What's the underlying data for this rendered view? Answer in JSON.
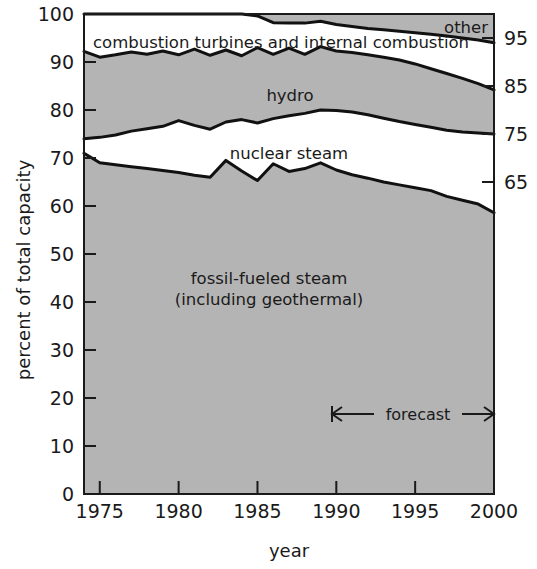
{
  "chart_data": {
    "type": "area",
    "title": "",
    "subtitle": "",
    "xlabel": "year",
    "ylabel": "percent of total capacity",
    "xlim": [
      1974,
      2000
    ],
    "ylim": [
      0,
      100
    ],
    "grid": false,
    "legend_position": "inline-labels",
    "stacked": true,
    "x": [
      1974,
      1975,
      1976,
      1977,
      1978,
      1979,
      1980,
      1981,
      1982,
      1983,
      1984,
      1985,
      1986,
      1987,
      1988,
      1989,
      1990,
      1991,
      1992,
      1993,
      1994,
      1995,
      1996,
      1997,
      1998,
      1999,
      2000
    ],
    "x_tick_labels": [
      "1975",
      "1980",
      "1985",
      "1990",
      "1995",
      "2000"
    ],
    "x_ticks": [
      1975,
      1980,
      1985,
      1990,
      1995,
      2000
    ],
    "y_tick_labels": [
      "0",
      "10",
      "20",
      "30",
      "40",
      "50",
      "60",
      "70",
      "80",
      "90",
      "100"
    ],
    "y_ticks": [
      0,
      10,
      20,
      30,
      40,
      50,
      60,
      70,
      80,
      90,
      100
    ],
    "y_right_tick_labels": [
      "65",
      "75",
      "85",
      "95"
    ],
    "y_right_ticks": [
      65,
      75,
      85,
      95
    ],
    "series": [
      {
        "name": "fossil-fueled steam (including geothermal)",
        "label": "fossil-fueled steam",
        "label_line2": "(including geothermal)",
        "fill": "#b4b4b4",
        "cumulative_top": [
          71.0,
          69.0,
          68.6,
          68.2,
          67.8,
          67.4,
          67.0,
          66.4,
          66.0,
          69.5,
          67.3,
          65.3,
          68.8,
          67.2,
          67.8,
          69.0,
          67.5,
          66.5,
          65.8,
          65.0,
          64.4,
          63.8,
          63.2,
          62.0,
          61.2,
          60.4,
          58.6
        ]
      },
      {
        "name": "nuclear steam",
        "label": "nuclear steam",
        "fill": "#ffffff",
        "cumulative_top": [
          74.0,
          74.3,
          74.8,
          75.6,
          76.1,
          76.6,
          77.8,
          76.8,
          76.0,
          77.5,
          78.0,
          77.3,
          78.2,
          78.8,
          79.3,
          80.0,
          79.9,
          79.6,
          79.0,
          78.3,
          77.6,
          77.0,
          76.4,
          75.8,
          75.4,
          75.2,
          75.0
        ]
      },
      {
        "name": "hydro",
        "label": "hydro",
        "fill": "#b4b4b4",
        "cumulative_top": [
          92.2,
          91.0,
          91.5,
          92.1,
          91.6,
          92.3,
          91.5,
          92.7,
          91.4,
          92.5,
          91.3,
          93.0,
          91.6,
          92.9,
          91.6,
          93.2,
          92.3,
          92.0,
          91.5,
          91.0,
          90.4,
          89.6,
          88.6,
          87.6,
          86.6,
          85.5,
          84.2
        ]
      },
      {
        "name": "combustion turbines and internal combustion",
        "label": "combustion turbines and internal combustion",
        "fill": "#ffffff",
        "cumulative_top": [
          100.0,
          100.0,
          100.0,
          100.0,
          100.0,
          100.0,
          100.0,
          100.0,
          100.0,
          100.0,
          100.0,
          99.6,
          98.2,
          98.1,
          98.1,
          98.5,
          97.8,
          97.4,
          97.0,
          96.7,
          96.4,
          96.1,
          95.8,
          95.4,
          95.0,
          94.6,
          94.0
        ]
      },
      {
        "name": "other",
        "label": "other",
        "fill": "#b4b4b4",
        "cumulative_top": [
          100.0,
          100.0,
          100.0,
          100.0,
          100.0,
          100.0,
          100.0,
          100.0,
          100.0,
          100.0,
          100.0,
          100.0,
          100.0,
          100.0,
          100.0,
          100.0,
          100.0,
          100.0,
          100.0,
          100.0,
          100.0,
          100.0,
          100.0,
          100.0,
          100.0,
          100.0,
          100.0
        ]
      }
    ],
    "annotations": [
      {
        "name": "forecast",
        "text": "forecast",
        "x_start": 1990.5,
        "x_end": 2000,
        "y": 15
      }
    ],
    "colors": {
      "fill_gray": "#b4b4b4",
      "fill_white": "#ffffff",
      "line": "#111111",
      "text": "#1a1a1a"
    }
  },
  "labels": {
    "ylabel": "percent of total capacity",
    "xlabel": "year",
    "combustion": "combustion turbines and internal combustion",
    "other": "other",
    "hydro": "hydro",
    "nuclear": "nuclear steam",
    "fossil_line1": "fossil-fueled steam",
    "fossil_line2": "(including geothermal)",
    "forecast": "forecast"
  }
}
